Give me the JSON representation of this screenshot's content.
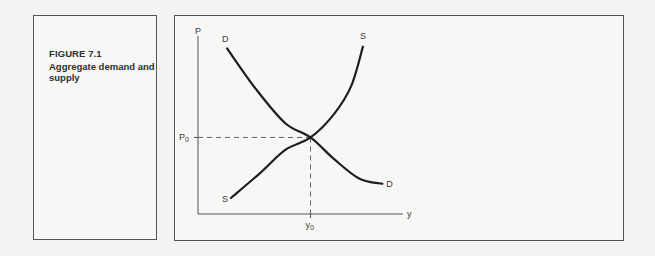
{
  "figure": {
    "number": "FIGURE 7.1",
    "title": "Aggregate demand and supply"
  },
  "chart_data": {
    "type": "line",
    "title": "Aggregate demand and supply",
    "xlabel": "y",
    "ylabel": "P",
    "xlim": [
      0,
      10
    ],
    "ylim": [
      0,
      10
    ],
    "grid": false,
    "legend": "none",
    "series": [
      {
        "name": "D",
        "label_start": "D",
        "label_end": "D",
        "shape": "downward-sloping convex",
        "points": [
          [
            1.5,
            9.3
          ],
          [
            3.0,
            7.0
          ],
          [
            4.5,
            5.1
          ],
          [
            5.8,
            4.3
          ],
          [
            7.0,
            3.1
          ],
          [
            8.3,
            2.0
          ],
          [
            9.5,
            1.7
          ]
        ]
      },
      {
        "name": "S",
        "label_start": "S",
        "label_end": "S",
        "shape": "upward-sloping convex",
        "points": [
          [
            1.7,
            0.9
          ],
          [
            3.2,
            2.3
          ],
          [
            4.5,
            3.6
          ],
          [
            5.8,
            4.3
          ],
          [
            7.0,
            5.6
          ],
          [
            7.9,
            7.2
          ],
          [
            8.5,
            9.4
          ]
        ]
      }
    ],
    "equilibrium": {
      "x": 5.8,
      "y": 4.3,
      "x_label": "y",
      "x_label_sub": "0",
      "y_label": "P",
      "y_label_sub": "0",
      "guide_lines": "dashed"
    }
  }
}
